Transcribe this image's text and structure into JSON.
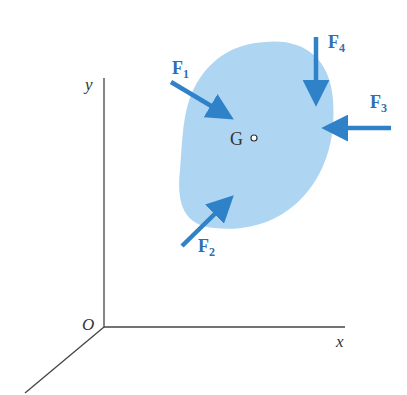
{
  "diagram": {
    "axes": {
      "y_label": "y",
      "x_label": "x",
      "origin_label": "O"
    },
    "body": {
      "centroid_label": "G",
      "fill_color": "#aed5f2"
    },
    "forces": [
      {
        "name": "F",
        "sub": "1"
      },
      {
        "name": "F",
        "sub": "2"
      },
      {
        "name": "F",
        "sub": "3"
      },
      {
        "name": "F",
        "sub": "4"
      }
    ],
    "colors": {
      "arrow": "#2f82c8",
      "axis": "#444444",
      "label_force": "#2f6fb0",
      "label_axis": "#333333"
    }
  }
}
